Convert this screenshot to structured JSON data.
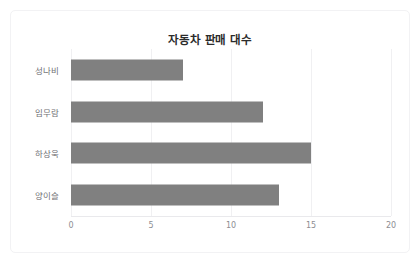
{
  "chart_data": {
    "type": "bar",
    "orientation": "horizontal",
    "title": "자동차 판매 대수",
    "xlabel": "",
    "ylabel": "",
    "categories": [
      "성나비",
      "임무람",
      "하상욱",
      "양이슬"
    ],
    "values": [
      7,
      12,
      15,
      13
    ],
    "series": [
      {
        "name": "판매 대수",
        "values": [
          7,
          12,
          15,
          13
        ]
      }
    ],
    "xlim": [
      0,
      20
    ],
    "xticks": [
      "0",
      "5",
      "10",
      "15",
      "20"
    ],
    "xtick_values": [
      0,
      5,
      10,
      15,
      20
    ],
    "grid": true,
    "grid_axis": "x",
    "legend": false,
    "bar_color": "#808080",
    "grid_color": "#f0f0f2",
    "axis_color": "#e9e9ec",
    "title_color": "#2b2b2b",
    "label_color": "#6f6f74",
    "tick_color": "#8d8d92",
    "background": "#ffffff",
    "border_color": "#f2f2f4"
  }
}
